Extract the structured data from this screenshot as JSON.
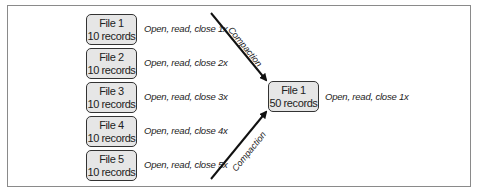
{
  "left_files": [
    {
      "name": "File 1",
      "records": "10 records",
      "note": "Open, read, close 1x"
    },
    {
      "name": "File 2",
      "records": "10 records",
      "note": "Open, read, close 2x"
    },
    {
      "name": "File 3",
      "records": "10 records",
      "note": "Open, read, close 3x"
    },
    {
      "name": "File 4",
      "records": "10 records",
      "note": "Open, read, close 4x"
    },
    {
      "name": "File 5",
      "records": "10 records",
      "note": "Open, read, close 5x"
    }
  ],
  "result_file": {
    "name": "File 1",
    "records": "50 records",
    "note": "Open, read, close 1x"
  },
  "arrows": [
    {
      "label": "Compaction",
      "direction": "down"
    },
    {
      "label": "Compaction",
      "direction": "up"
    }
  ],
  "colors": {
    "box_fill": "#e6e6e6",
    "box_border": "#333333",
    "frame": "#8a8a8a"
  }
}
